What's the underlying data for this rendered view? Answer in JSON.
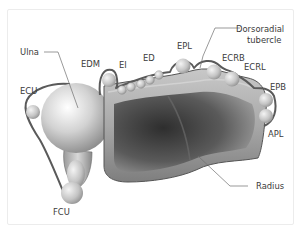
{
  "diagram": {
    "type": "anatomical cross-section",
    "labels": {
      "ulna": "Ulna",
      "ecu": "ECU",
      "edm": "EDM",
      "ei": "EI",
      "ed": "ED",
      "epl": "EPL",
      "dorsoradial_tubercle_line1": "Dorsoradial",
      "dorsoradial_tubercle_line2": "tubercle",
      "ecrb": "ECRB",
      "ecrl": "ECRL",
      "epb": "EPB",
      "apl": "APL",
      "radius": "Radius",
      "fcu": "FCU"
    },
    "colors": {
      "bone_light": "#e8e8e8",
      "bone_mid": "#b4b4b4",
      "bone_dark": "#4a4a4a",
      "sheath": "#5a5a5a",
      "label_text": "#3a3a3a"
    }
  }
}
